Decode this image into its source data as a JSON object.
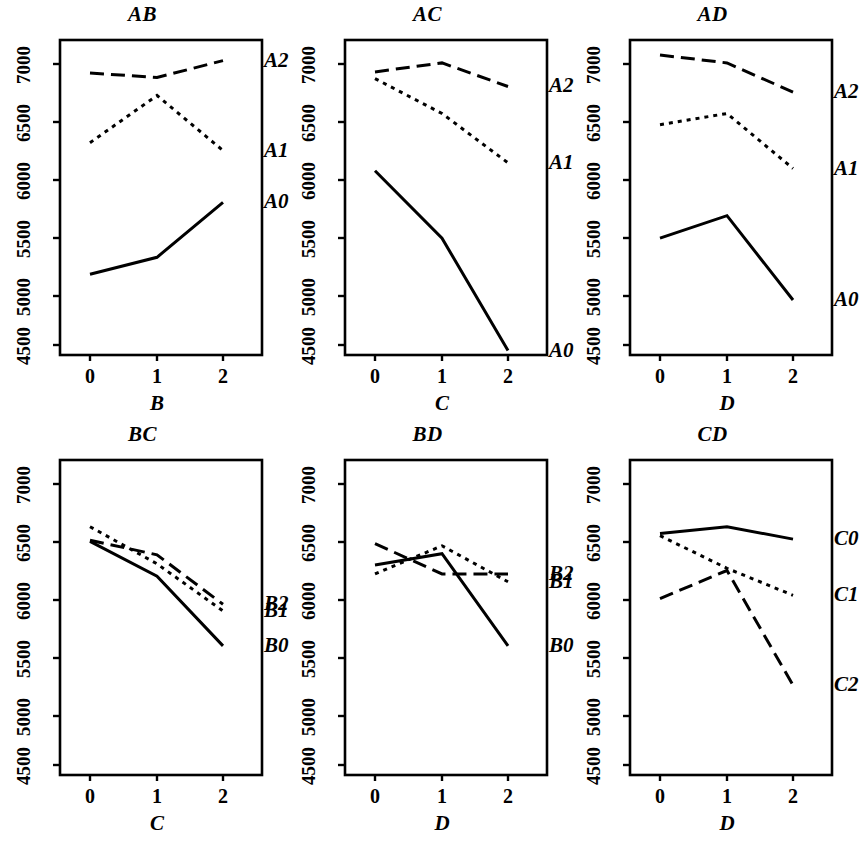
{
  "figure": {
    "kind": "interaction-plot-matrix",
    "rows": 2,
    "cols": 3,
    "axis_color": "#000000",
    "line_color": "#000000"
  },
  "chart_data": [
    {
      "type": "line",
      "title": "AB",
      "xlabel": "B",
      "ylabel": "",
      "x": [
        0,
        1,
        2
      ],
      "xticklabels": [
        "0",
        "1",
        "2"
      ],
      "yticklabels": [
        "4500",
        "5000",
        "5500",
        "6000",
        "6500",
        "7000"
      ],
      "yticks": [
        4500,
        5000,
        5500,
        6000,
        6500,
        7000
      ],
      "ylim": [
        4350,
        7200
      ],
      "grid": false,
      "legend": "inline-right",
      "series": [
        {
          "name": "A2",
          "style": "dashed",
          "values": [
            6920,
            6880,
            7030
          ]
        },
        {
          "name": "A1",
          "style": "dotted",
          "values": [
            6300,
            6720,
            6230
          ]
        },
        {
          "name": "A0",
          "style": "solid",
          "values": [
            5130,
            5280,
            5770
          ]
        }
      ]
    },
    {
      "type": "line",
      "title": "AC",
      "xlabel": "C",
      "ylabel": "",
      "x": [
        0,
        1,
        2
      ],
      "xticklabels": [
        "0",
        "1",
        "2"
      ],
      "yticklabels": [
        "4500",
        "5000",
        "5500",
        "6000",
        "6500",
        "7000"
      ],
      "yticks": [
        4500,
        5000,
        5500,
        6000,
        6500,
        7000
      ],
      "ylim": [
        4350,
        7200
      ],
      "grid": false,
      "legend": "inline-right",
      "series": [
        {
          "name": "A2",
          "style": "dashed",
          "values": [
            6930,
            7010,
            6800
          ]
        },
        {
          "name": "A1",
          "style": "dotted",
          "values": [
            6870,
            6560,
            6120
          ]
        },
        {
          "name": "A0",
          "style": "solid",
          "values": [
            6050,
            5450,
            4450
          ]
        }
      ]
    },
    {
      "type": "line",
      "title": "AD",
      "xlabel": "D",
      "ylabel": "",
      "x": [
        0,
        1,
        2
      ],
      "xticklabels": [
        "0",
        "1",
        "2"
      ],
      "yticklabels": [
        "4500",
        "5000",
        "5500",
        "6000",
        "6500",
        "7000"
      ],
      "yticks": [
        4500,
        5000,
        5500,
        6000,
        6500,
        7000
      ],
      "ylim": [
        4350,
        7200
      ],
      "grid": false,
      "legend": "inline-right",
      "series": [
        {
          "name": "A2",
          "style": "dashed",
          "values": [
            7080,
            7010,
            6750
          ]
        },
        {
          "name": "A1",
          "style": "dotted",
          "values": [
            6460,
            6560,
            6070
          ]
        },
        {
          "name": "A0",
          "style": "solid",
          "values": [
            5450,
            5650,
            4900
          ]
        }
      ]
    },
    {
      "type": "line",
      "title": "BC",
      "xlabel": "C",
      "ylabel": "",
      "x": [
        0,
        1,
        2
      ],
      "xticklabels": [
        "0",
        "1",
        "2"
      ],
      "yticklabels": [
        "4500",
        "5000",
        "5500",
        "6000",
        "6500",
        "7000"
      ],
      "yticks": [
        4500,
        5000,
        5500,
        6000,
        6500,
        7000
      ],
      "ylim": [
        4350,
        7200
      ],
      "grid": false,
      "legend": "inline-right",
      "series": [
        {
          "name": "B2",
          "style": "dashed",
          "values": [
            6500,
            6370,
            5930
          ]
        },
        {
          "name": "B1",
          "style": "dotted",
          "values": [
            6620,
            6290,
            5870
          ]
        },
        {
          "name": "B0",
          "style": "solid",
          "values": [
            6490,
            6180,
            5560
          ]
        }
      ]
    },
    {
      "type": "line",
      "title": "BD",
      "xlabel": "D",
      "ylabel": "",
      "x": [
        0,
        1,
        2
      ],
      "xticklabels": [
        "0",
        "1",
        "2"
      ],
      "yticklabels": [
        "4500",
        "5000",
        "5500",
        "6000",
        "6500",
        "7000"
      ],
      "yticks": [
        4500,
        5000,
        5500,
        6000,
        6500,
        7000
      ],
      "ylim": [
        4350,
        7200
      ],
      "grid": false,
      "legend": "inline-right",
      "series": [
        {
          "name": "B2",
          "style": "dashed",
          "values": [
            6470,
            6200,
            6200
          ]
        },
        {
          "name": "B1",
          "style": "dotted",
          "values": [
            6200,
            6450,
            6130
          ]
        },
        {
          "name": "B0",
          "style": "solid",
          "values": [
            6280,
            6380,
            5560
          ]
        }
      ]
    },
    {
      "type": "line",
      "title": "CD",
      "xlabel": "D",
      "ylabel": "",
      "x": [
        0,
        1,
        2
      ],
      "xticklabels": [
        "0",
        "1",
        "2"
      ],
      "yticklabels": [
        "4500",
        "5000",
        "5500",
        "6000",
        "6500",
        "7000"
      ],
      "yticks": [
        4500,
        5000,
        5500,
        6000,
        6500,
        7000
      ],
      "ylim": [
        4350,
        7200
      ],
      "grid": false,
      "legend": "inline-right",
      "series": [
        {
          "name": "C0",
          "style": "solid",
          "values": [
            6560,
            6620,
            6510
          ]
        },
        {
          "name": "C1",
          "style": "dotted",
          "values": [
            6540,
            6250,
            6010
          ]
        },
        {
          "name": "C2",
          "style": "dashed",
          "values": [
            5980,
            6230,
            5210
          ]
        }
      ]
    }
  ]
}
